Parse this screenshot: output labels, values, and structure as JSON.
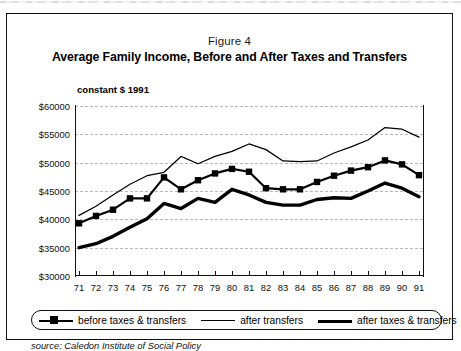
{
  "figure": {
    "number_label": "Figure 4",
    "title": "Average Family Income, Before and After Taxes and Transfers",
    "units_label": "constant $ 1991",
    "source": "source: Caledon Institute of Social Policy"
  },
  "legend": {
    "items": [
      {
        "label": "before taxes & transfers",
        "style": "line-with-square-markers",
        "color": "#000000"
      },
      {
        "label": "after transfers",
        "style": "thin-line",
        "color": "#000000"
      },
      {
        "label": "after taxes & transfers",
        "style": "thick-line",
        "color": "#000000"
      }
    ]
  },
  "chart_data": {
    "type": "line",
    "title": "Average Family Income, Before and After Taxes and Transfers",
    "subtitle": "Figure 4",
    "xlabel": "",
    "ylabel": "constant $ 1991",
    "xlim": [
      1971,
      1991
    ],
    "ylim": [
      30000,
      60000
    ],
    "ytick_step": 5000,
    "ytick_labels": [
      "$60000",
      "$55000",
      "$50000",
      "$45000",
      "$40000",
      "$35000",
      "$30000"
    ],
    "ytick_values": [
      60000,
      55000,
      50000,
      45000,
      40000,
      35000,
      30000
    ],
    "grid": "horizontal-dashed",
    "legend_position": "below-plot",
    "x": [
      1971,
      1972,
      1973,
      1974,
      1975,
      1976,
      1977,
      1978,
      1979,
      1980,
      1981,
      1982,
      1983,
      1984,
      1985,
      1986,
      1987,
      1988,
      1989,
      1990,
      1991
    ],
    "xtick_labels": [
      "71",
      "72",
      "73",
      "74",
      "75",
      "76",
      "77",
      "78",
      "79",
      "80",
      "81",
      "82",
      "83",
      "84",
      "85",
      "86",
      "87",
      "88",
      "89",
      "90",
      "91"
    ],
    "series": [
      {
        "name": "after transfers",
        "marker": "none",
        "linewidth": "thin",
        "values": [
          40700,
          42300,
          44300,
          46200,
          47700,
          48300,
          51100,
          49800,
          51100,
          52000,
          53300,
          52300,
          50300,
          50200,
          50300,
          51700,
          52800,
          54000,
          56200,
          55900,
          54500
        ]
      },
      {
        "name": "before taxes & transfers",
        "marker": "square",
        "linewidth": "medium",
        "values": [
          39300,
          40600,
          41700,
          43700,
          43700,
          47400,
          45300,
          46900,
          48100,
          48900,
          48400,
          45500,
          45300,
          45300,
          46600,
          47700,
          48600,
          49200,
          50400,
          49700,
          47800
        ]
      },
      {
        "name": "after taxes & transfers",
        "marker": "none",
        "linewidth": "thick",
        "values": [
          35000,
          35700,
          37000,
          38600,
          40100,
          42800,
          41900,
          43700,
          43000,
          45300,
          44300,
          43000,
          42500,
          42500,
          43500,
          43800,
          43700,
          45000,
          46400,
          45500,
          44000
        ]
      }
    ]
  }
}
